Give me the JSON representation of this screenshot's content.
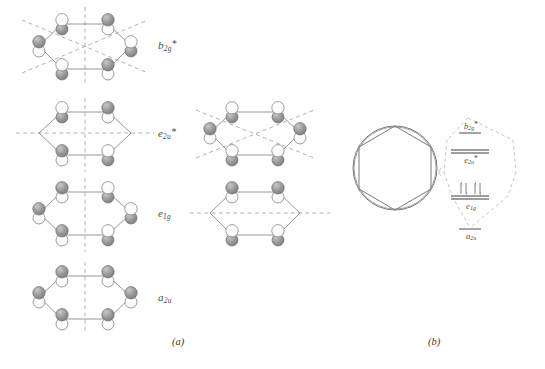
{
  "figure": {
    "panels": [
      {
        "id": "a",
        "caption": "(a)"
      },
      {
        "id": "b",
        "caption": "(b)"
      }
    ]
  },
  "colors": {
    "lobe_dark": "#8c8c8c",
    "lobe_light": "#ffffff",
    "outline": "#6e6e6e",
    "ring_bond": "#7a7a7a",
    "node_dash": "#9a9a9a",
    "text": "#4a4a4a",
    "level_line": "#8a8a8a",
    "envelope": "#b0b0b0"
  },
  "panel_a": {
    "rows": [
      {
        "label_text": "b",
        "label_sub": "2g",
        "label_star": "*",
        "degenerate": false,
        "node_count": 3,
        "diagrams": [
          {
            "position": "left",
            "phases": [
              "light",
              "dark",
              "light",
              "dark",
              "light",
              "dark"
            ],
            "node_lines": [
              "vertical",
              "diag-down",
              "diag-up"
            ]
          }
        ]
      },
      {
        "label_text": "e",
        "label_sub": "2u",
        "label_star": "*",
        "degenerate": true,
        "node_count": 2,
        "diagrams": [
          {
            "position": "left",
            "phases": [
              "dark",
              "light",
              "none",
              "dark",
              "light",
              "none"
            ],
            "node_lines": [
              "vertical",
              "horizontal"
            ]
          },
          {
            "position": "middle",
            "phases": [
              "dark",
              "dark",
              "light",
              "light",
              "light",
              "dark"
            ],
            "node_lines": [
              "diag-down",
              "diag-up"
            ]
          }
        ]
      },
      {
        "label_text": "e",
        "label_sub": "1g",
        "label_star": "",
        "degenerate": true,
        "node_count": 1,
        "diagrams": [
          {
            "position": "left",
            "phases": [
              "dark",
              "light",
              "dark",
              "light",
              "dark",
              "light"
            ],
            "node_lines": [
              "vertical"
            ]
          },
          {
            "position": "middle",
            "phases": [
              "dark",
              "dark",
              "none",
              "light",
              "light",
              "none"
            ],
            "node_lines": [
              "horizontal"
            ]
          }
        ]
      },
      {
        "label_text": "a",
        "label_sub": "2u",
        "label_star": "",
        "degenerate": false,
        "node_count": 0,
        "diagrams": [
          {
            "position": "left",
            "phases": [
              "dark",
              "dark",
              "dark",
              "dark",
              "dark",
              "dark"
            ],
            "node_lines": [
              "vertical"
            ]
          }
        ]
      }
    ]
  },
  "panel_b": {
    "ring_model": {
      "shape": "hexagon-in-circle",
      "description": "delocalised pi ring"
    },
    "energy_levels": [
      {
        "name": "b",
        "sub": "2g",
        "star": "*",
        "degeneracy": 1,
        "electrons": 0,
        "occupancy": []
      },
      {
        "name": "e",
        "sub": "2u",
        "star": "*",
        "degeneracy": 2,
        "electrons": 0,
        "occupancy": []
      },
      {
        "name": "e",
        "sub": "1g",
        "star": "",
        "degeneracy": 2,
        "electrons": 4,
        "occupancy": [
          "updown",
          "updown"
        ]
      },
      {
        "name": "a",
        "sub": "2u",
        "star": "",
        "degeneracy": 1,
        "electrons": 2,
        "occupancy": []
      }
    ],
    "total_pi_electrons": 6
  }
}
